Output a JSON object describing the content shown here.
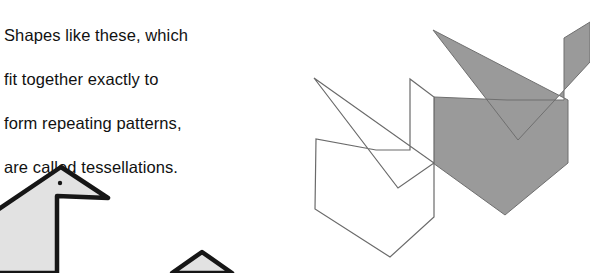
{
  "page": {
    "width": 590,
    "height": 273,
    "background": "#ffffff"
  },
  "caption": {
    "full_text": "Shapes like these, which fit together exactly to form repeating patterns, are called tessellations.",
    "lines": [
      "Shapes like these, which",
      "fit together exactly to",
      "form repeating patterns,",
      "are called tessellations."
    ],
    "color": "#111111"
  },
  "figure": {
    "label": "tessellation-figure",
    "colors": {
      "gray_tile_fill": "#9a9a9a",
      "gray_tile_stroke": "#6f6f6f",
      "white_tile_fill": "#ffffff",
      "white_tile_stroke": "#6a6a6a",
      "bird_tile_fill": "#e2e2e2",
      "bird_tile_stroke": "#161616",
      "eye_color": "#161616"
    },
    "shapes": [
      {
        "name": "white-tessellation-tile",
        "fill": "#ffffff",
        "stroke": "#6a6a6a",
        "stroke_width": 1.2,
        "points": "314,78 398,188 434,163 434,97 410,79 410,150 376,150 316,139 315,209 390,257 434,217 434,163"
      },
      {
        "name": "gray-tessellation-tile",
        "fill": "#9a9a9a",
        "stroke": "#6f6f6f",
        "stroke_width": 1.0,
        "points": "433,30 518,140 590,62 590,22 564,38 564,100 507,100 434,97 433,163 505,215 568,163 568,100"
      },
      {
        "name": "bird-tile-large",
        "fill": "#e2e2e2",
        "stroke": "#161616",
        "stroke_width": 4.5,
        "points": "61,167 108,198 57,196 57,273 -40,273 -40,232 -10,215"
      },
      {
        "name": "bird-tile-small",
        "fill": "#e2e2e2",
        "stroke": "#161616",
        "stroke_width": 4.5,
        "points": "202,252 232,273 172,273"
      }
    ],
    "eye": {
      "name": "bird-eye-dot",
      "cx": 60,
      "cy": 183,
      "r": 2.2,
      "color": "#161616"
    }
  }
}
